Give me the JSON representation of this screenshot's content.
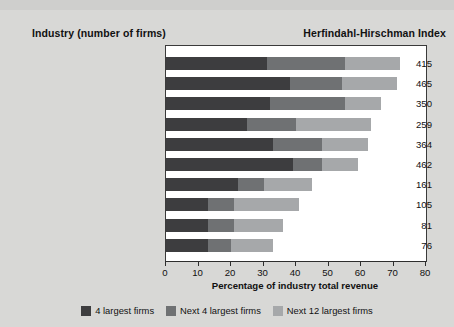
{
  "headers": {
    "left": "Industry (number of firms)",
    "right": "Herfindahl-Hirschman Index"
  },
  "axis": {
    "title": "Percentage of industry total revenue",
    "ticks": [
      "0",
      "10",
      "20",
      "30",
      "40",
      "50",
      "60",
      "70",
      "80"
    ]
  },
  "legend": [
    {
      "label": "4 largest firms",
      "color": "#3d3d3f"
    },
    {
      "label": "Next 4 largest firms",
      "color": "#6f7173"
    },
    {
      "label": "Next 12 largest firms",
      "color": "#a6a8aa"
    }
  ],
  "chart_data": {
    "type": "bar",
    "orientation": "horizontal",
    "stacked": true,
    "title": "",
    "xlabel": "Percentage of industry total revenue",
    "ylabel": "Industry (number of firms)",
    "xlim": [
      0,
      80
    ],
    "grid": false,
    "legend_position": "bottom",
    "categories": [
      "Audio and video equipment  (521)",
      "Computers  (1870)",
      "Frozen foods  (531)",
      "Canned foods  (661)",
      "Book printing  (690)",
      "Men's and boy's clothing  (1362)",
      "Sporting goods  (2477)",
      "Fish and seafood  (731)",
      "Jewelry  (2278)",
      "Women's and girl's clothing  (2927)"
    ],
    "series": [
      {
        "name": "4 largest firms",
        "values": [
          31,
          38,
          32,
          25,
          33,
          39,
          22,
          13,
          13,
          13
        ]
      },
      {
        "name": "Next 4 largest firms",
        "values": [
          24,
          16,
          23,
          15,
          15,
          9,
          8,
          8,
          8,
          7
        ]
      },
      {
        "name": "Next 12 largest firms",
        "values": [
          17,
          17,
          11,
          23,
          14,
          11,
          15,
          20,
          15,
          13
        ]
      }
    ],
    "annotations": {
      "name": "Herfindahl-Hirschman Index",
      "values": [
        415,
        465,
        350,
        259,
        364,
        462,
        161,
        105,
        81,
        76
      ]
    }
  }
}
